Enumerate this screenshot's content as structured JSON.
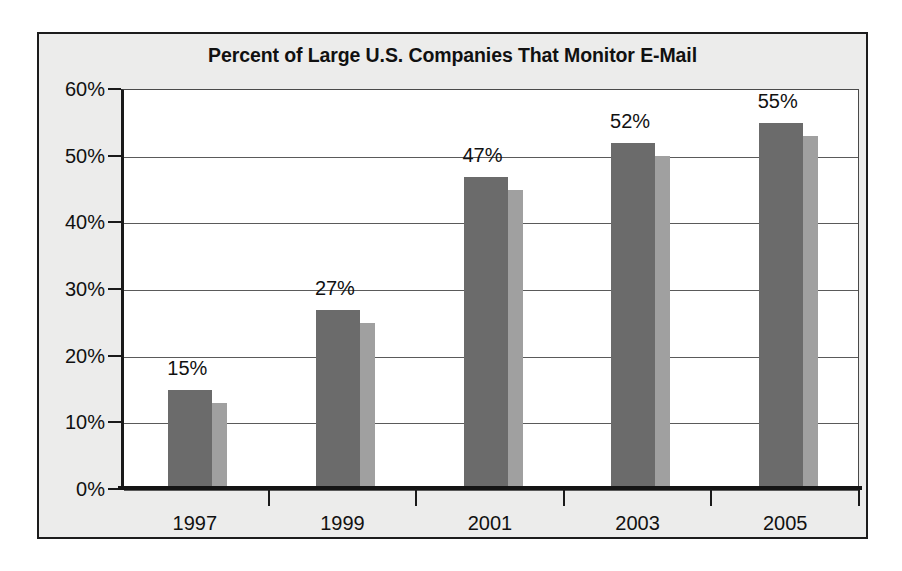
{
  "chart_data": {
    "type": "bar",
    "title": "Percent of Large U.S. Companies That Monitor E-Mail",
    "xlabel": "",
    "ylabel": "",
    "categories": [
      "1997",
      "1999",
      "2001",
      "2003",
      "2005"
    ],
    "values": [
      15,
      27,
      47,
      52,
      55
    ],
    "value_labels": [
      "15%",
      "27%",
      "47%",
      "52%",
      "55%"
    ],
    "series": [
      {
        "name": "Percent of large U.S. companies that monitor e-mail",
        "values": [
          15,
          27,
          47,
          52,
          55
        ]
      }
    ],
    "ylim": [
      0,
      60
    ],
    "ytick_values": [
      0,
      10,
      20,
      30,
      40,
      50,
      60
    ],
    "ytick_labels": [
      "0%",
      "10%",
      "20%",
      "30%",
      "40%",
      "50%",
      "60%"
    ],
    "grid": true,
    "grid_axis": "y",
    "legend": false,
    "legend_position": "none",
    "annotations": [],
    "colors": {
      "bar_face": "#6b6b6b",
      "bar_shadow": "#a0a0a0",
      "frame_background": "#ececeb",
      "plot_background": "#ffffff",
      "axis": "#151515",
      "gridline": "#5a5a5a",
      "text": "#111111",
      "page_background": "#ffffff"
    }
  }
}
